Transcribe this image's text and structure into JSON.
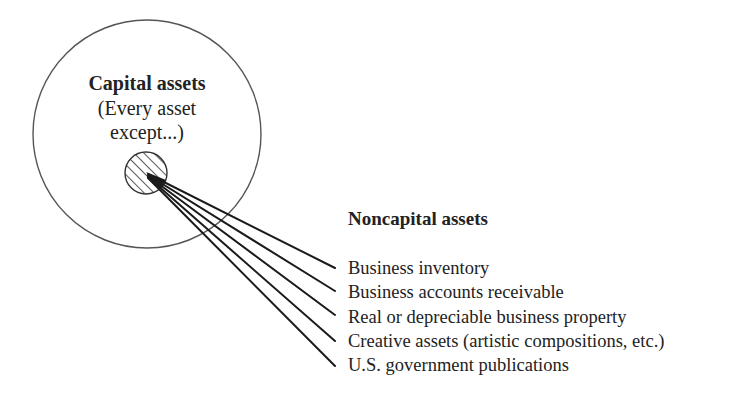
{
  "capital_assets": {
    "title": "Capital assets",
    "subtitle_line1": "(Every asset",
    "subtitle_line2": "except...)"
  },
  "noncapital_assets": {
    "title": "Noncapital assets",
    "items": [
      "Business inventory",
      "Business accounts receivable",
      "Real or depreciable business property",
      "Creative assets (artistic compositions, etc.)",
      "U.S. government publications"
    ]
  },
  "colors": {
    "circle_stroke": "#555555",
    "line_stroke": "#1a1a1a",
    "text": "#222222",
    "background": "#ffffff"
  }
}
